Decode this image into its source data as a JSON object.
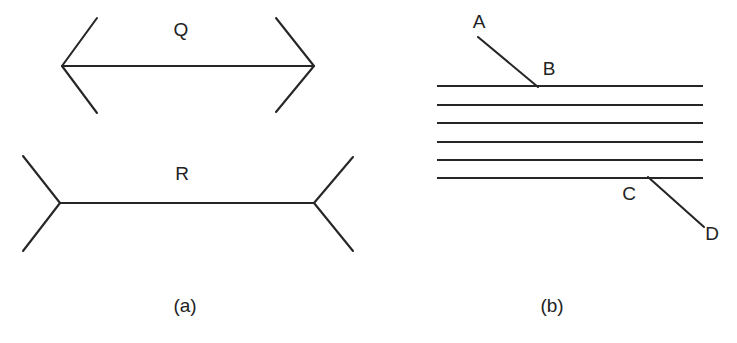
{
  "figure": {
    "background_color": "#ffffff",
    "stroke_color": "#262626",
    "text_color": "#222222",
    "panels": [
      {
        "caption": "(a)",
        "caption_x": 185,
        "caption_y": 307,
        "name": "muller-lyer-panel",
        "figures": [
          {
            "label": "Q",
            "label_x": 181,
            "label_y": 31,
            "type": "arrowheads-inward",
            "shaft": {
              "x1": 62,
              "y1": 66,
              "x2": 314,
              "y2": 66
            },
            "fins": [
              {
                "x1": 62,
                "y1": 66,
                "x2": 97,
                "y2": 18
              },
              {
                "x1": 62,
                "y1": 66,
                "x2": 97,
                "y2": 113
              },
              {
                "x1": 314,
                "y1": 66,
                "x2": 276,
                "y2": 18
              },
              {
                "x1": 314,
                "y1": 66,
                "x2": 276,
                "y2": 112
              }
            ]
          },
          {
            "label": "R",
            "label_x": 182,
            "label_y": 175,
            "type": "arrowheads-outward",
            "shaft": {
              "x1": 60,
              "y1": 203,
              "x2": 314,
              "y2": 203
            },
            "fins": [
              {
                "x1": 60,
                "y1": 203,
                "x2": 23,
                "y2": 156
              },
              {
                "x1": 60,
                "y1": 203,
                "x2": 23,
                "y2": 251
              },
              {
                "x1": 314,
                "y1": 203,
                "x2": 353,
                "y2": 157
              },
              {
                "x1": 314,
                "y1": 203,
                "x2": 353,
                "y2": 251
              }
            ]
          }
        ]
      },
      {
        "caption": "(b)",
        "caption_x": 552,
        "caption_y": 307,
        "name": "poggendorff-panel",
        "horizontal_lines": {
          "x_left": 437,
          "x_right": 703,
          "y_values": [
            86,
            105,
            123,
            142,
            160,
            178
          ],
          "count": 6
        },
        "diagonals": [
          {
            "name": "segment-AB",
            "x1": 478,
            "y1": 37,
            "x2": 538,
            "y2": 87,
            "endpoint_labels": [
              {
                "text": "A",
                "x": 479,
                "y": 23
              },
              {
                "text": "B",
                "x": 549,
                "y": 70
              }
            ]
          },
          {
            "name": "segment-CD",
            "x1": 648,
            "y1": 177,
            "x2": 704,
            "y2": 227,
            "endpoint_labels": [
              {
                "text": "C",
                "x": 629,
                "y": 195
              },
              {
                "text": "D",
                "x": 712,
                "y": 235
              }
            ]
          }
        ]
      }
    ]
  },
  "labels": {
    "q": "Q",
    "r": "R",
    "a_point": "A",
    "b_point": "B",
    "c_point": "C",
    "d_point": "D",
    "caption_a": "(a)",
    "caption_b": "(b)"
  }
}
